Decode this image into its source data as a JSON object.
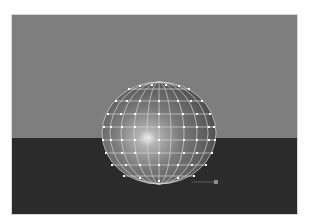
{
  "viewport": {
    "label": "3D viewport render",
    "colors": {
      "sky": "#7e7e7e",
      "ground": "#2b2b2b",
      "sphere_base": "#6e6e6e",
      "sphere_highlight": "#e8e8e8",
      "wireframe": "#d8d8d8",
      "control_vertex": "#ffffff",
      "manipulator_handle": "#8a8a8a"
    },
    "object": {
      "type": "NURBS sphere",
      "display": "shaded with wireframe and control vertices",
      "spans_u": 12,
      "spans_v": 8
    }
  }
}
